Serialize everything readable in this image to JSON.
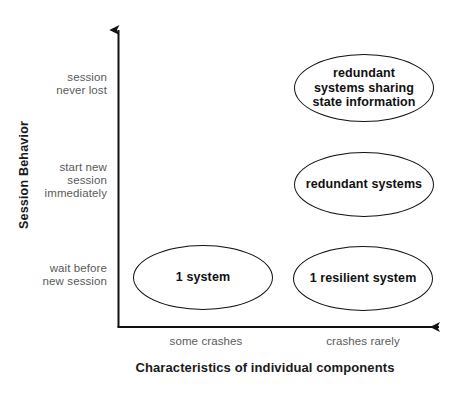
{
  "figure": {
    "type": "quadrant-diagram",
    "background_color": "#ffffff",
    "line_color": "#111111",
    "tick_label_color": "#5a5a5a",
    "title_color": "#1a1a1a"
  },
  "y_axis": {
    "title": "Session Behavior",
    "ticks": [
      {
        "label": "session\nnever lost"
      },
      {
        "label": "start new\nsession\nimmediately"
      },
      {
        "label": "wait before\nnew session"
      }
    ]
  },
  "x_axis": {
    "title": "Characteristics of individual components",
    "ticks": [
      {
        "label": "some crashes"
      },
      {
        "label": "crashes rarely"
      }
    ]
  },
  "nodes": [
    {
      "id": "redundant-systems-sharing-state",
      "label": "redundant\nsystems sharing\nstate information",
      "x_category": "crashes rarely",
      "y_category": "session never lost"
    },
    {
      "id": "redundant-systems",
      "label": "redundant systems",
      "x_category": "crashes rarely",
      "y_category": "start new session immediately"
    },
    {
      "id": "one-system",
      "label": "1 system",
      "x_category": "some crashes",
      "y_category": "wait before new session"
    },
    {
      "id": "one-resilient-system",
      "label": "1 resilient system",
      "x_category": "crashes rarely",
      "y_category": "wait before new session"
    }
  ]
}
